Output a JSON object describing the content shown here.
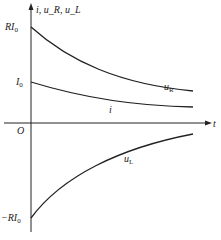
{
  "diagram": {
    "type": "time-response plot (RL circuit decay)",
    "axes": {
      "y_label": "i, u_R, u_L",
      "x_label": "t",
      "origin_label": "O"
    },
    "tick_labels": {
      "RI0": "RI",
      "I0": "I",
      "negRI0": "−RI",
      "subscript": "0"
    },
    "curves": [
      {
        "name": "u_R",
        "label_main": "u",
        "label_sub": "R",
        "start": "RI0",
        "shape": "exponential decay toward 0"
      },
      {
        "name": "i",
        "label_main": "i",
        "label_sub": "",
        "start": "I0",
        "shape": "exponential decay toward 0"
      },
      {
        "name": "u_L",
        "label_main": "u",
        "label_sub": "L",
        "start": "-RI0",
        "shape": "exponential rise toward 0"
      }
    ],
    "colors": {
      "line": "#222222",
      "background": "#ffffff"
    }
  }
}
